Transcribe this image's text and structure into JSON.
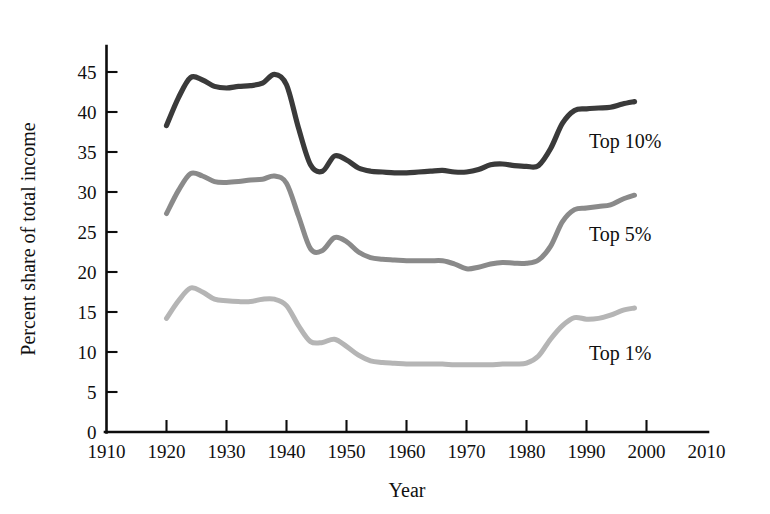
{
  "chart_data": {
    "type": "line",
    "title": "",
    "xlabel": "Year",
    "ylabel": "Percent share of total income",
    "xlim": [
      1910,
      2010
    ],
    "ylim": [
      0,
      47
    ],
    "grid": false,
    "legend_position": "inline-right-of-line-ends",
    "x_ticks": [
      "1910",
      "1920",
      "1930",
      "1940",
      "1950",
      "1960",
      "1970",
      "1980",
      "1990",
      "2000",
      "2010"
    ],
    "y_ticks": [
      "0",
      "5",
      "10",
      "15",
      "20",
      "25",
      "30",
      "35",
      "40",
      "45"
    ],
    "series": [
      {
        "name": "Top 10%",
        "label": "Top 10%",
        "color": "#3a3a3a",
        "stroke_width": 5.2,
        "x": [
          1920,
          1922,
          1924,
          1926,
          1928,
          1930,
          1932,
          1934,
          1936,
          1938,
          1940,
          1942,
          1944,
          1946,
          1948,
          1950,
          1952,
          1954,
          1956,
          1958,
          1960,
          1962,
          1964,
          1966,
          1968,
          1970,
          1972,
          1974,
          1976,
          1978,
          1980,
          1982,
          1984,
          1986,
          1988,
          1990,
          1992,
          1994,
          1996,
          1998
        ],
        "values": [
          38.3,
          41.8,
          44.3,
          44.0,
          43.2,
          43.0,
          43.2,
          43.3,
          43.6,
          44.7,
          43.4,
          38.0,
          33.4,
          32.6,
          34.5,
          34.0,
          33.0,
          32.6,
          32.5,
          32.4,
          32.4,
          32.5,
          32.6,
          32.7,
          32.5,
          32.5,
          32.8,
          33.4,
          33.5,
          33.3,
          33.2,
          33.3,
          35.4,
          38.6,
          40.2,
          40.4,
          40.5,
          40.6,
          41.0,
          41.3
        ]
      },
      {
        "name": "Top 5%",
        "label": "Top 5%",
        "color": "#8a8a8a",
        "stroke_width": 5.0,
        "x": [
          1920,
          1922,
          1924,
          1926,
          1928,
          1930,
          1932,
          1934,
          1936,
          1938,
          1940,
          1942,
          1944,
          1946,
          1948,
          1950,
          1952,
          1954,
          1956,
          1958,
          1960,
          1962,
          1964,
          1966,
          1968,
          1970,
          1972,
          1974,
          1976,
          1978,
          1980,
          1982,
          1984,
          1986,
          1988,
          1990,
          1992,
          1994,
          1996,
          1998
        ],
        "values": [
          27.3,
          30.2,
          32.3,
          32.0,
          31.3,
          31.2,
          31.3,
          31.5,
          31.6,
          32.0,
          31.1,
          27.0,
          22.9,
          22.7,
          24.3,
          23.8,
          22.5,
          21.8,
          21.6,
          21.5,
          21.4,
          21.4,
          21.4,
          21.4,
          21.0,
          20.4,
          20.6,
          21.0,
          21.2,
          21.1,
          21.1,
          21.5,
          23.2,
          26.3,
          27.8,
          28.0,
          28.2,
          28.4,
          29.1,
          29.6
        ]
      },
      {
        "name": "Top 1%",
        "label": "Top 1%",
        "color": "#b5b5b5",
        "stroke_width": 5.0,
        "x": [
          1920,
          1922,
          1924,
          1926,
          1928,
          1930,
          1932,
          1934,
          1936,
          1938,
          1940,
          1942,
          1944,
          1946,
          1948,
          1950,
          1952,
          1954,
          1956,
          1958,
          1960,
          1962,
          1964,
          1966,
          1968,
          1970,
          1972,
          1974,
          1976,
          1978,
          1980,
          1982,
          1984,
          1986,
          1988,
          1990,
          1992,
          1994,
          1996,
          1998
        ],
        "values": [
          14.2,
          16.4,
          18.0,
          17.5,
          16.6,
          16.4,
          16.3,
          16.3,
          16.6,
          16.6,
          15.8,
          13.3,
          11.3,
          11.2,
          11.6,
          10.7,
          9.6,
          8.9,
          8.7,
          8.6,
          8.5,
          8.5,
          8.5,
          8.5,
          8.4,
          8.4,
          8.4,
          8.4,
          8.5,
          8.5,
          8.6,
          9.5,
          11.6,
          13.3,
          14.3,
          14.1,
          14.2,
          14.6,
          15.2,
          15.5
        ]
      }
    ]
  },
  "axis": {
    "x_title": "Year",
    "y_title": "Percent share of total income"
  }
}
